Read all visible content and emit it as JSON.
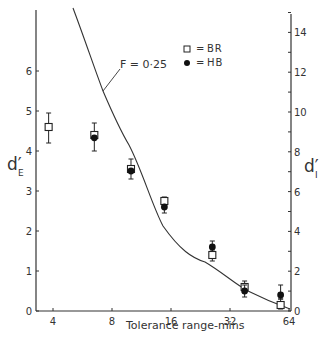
{
  "chart_data": {
    "type": "scatter",
    "title": "",
    "xlabel": "Tolerance range-mins",
    "x_scale": "log2",
    "x_ticks": [
      4,
      8,
      16,
      32,
      64
    ],
    "xlim": [
      3.3,
      64
    ],
    "ylabel_left": "d'E",
    "ylabel_left_main": "d′",
    "ylabel_left_sub": "E",
    "ylim_left": [
      0,
      7.5
    ],
    "y_ticks_left": [
      0,
      1,
      2,
      3,
      4,
      5,
      6
    ],
    "ylabel_right": "d'I",
    "ylabel_right_main": "d′",
    "ylabel_right_sub": "I",
    "ylim_right": [
      0,
      15
    ],
    "y_ticks_right": [
      0,
      2,
      4,
      6,
      8,
      10,
      12,
      14
    ],
    "grid": false,
    "legend_position": "upper-right-inside",
    "legend": [
      {
        "marker": "open-square",
        "symbol": "□",
        "eq": "=",
        "label": "BR"
      },
      {
        "marker": "filled-circle",
        "symbol": "●",
        "eq": "=",
        "label": "HB"
      }
    ],
    "series": [
      {
        "name": "BR",
        "marker": "open-square",
        "points": [
          {
            "x": 3.8,
            "y": 4.6,
            "err_low": 4.2,
            "err_high": 4.95
          },
          {
            "x": 6.5,
            "y": 4.4,
            "err_low": 4.0,
            "err_high": 4.7
          },
          {
            "x": 10.0,
            "y": 3.55,
            "err_low": 3.3,
            "err_high": 3.8
          },
          {
            "x": 14.8,
            "y": 2.75,
            "err_low": 2.45,
            "err_high": 2.85
          },
          {
            "x": 26.0,
            "y": 1.4,
            "err_low": 1.25,
            "err_high": 1.55
          },
          {
            "x": 38.0,
            "y": 0.6,
            "err_low": 0.45,
            "err_high": 0.75
          },
          {
            "x": 58.0,
            "y": 0.15,
            "err_low": 0.05,
            "err_high": 0.3
          }
        ]
      },
      {
        "name": "HB",
        "marker": "filled-circle",
        "points": [
          {
            "x": 6.5,
            "y": 4.33
          },
          {
            "x": 10.0,
            "y": 3.5
          },
          {
            "x": 14.8,
            "y": 2.6
          },
          {
            "x": 26.0,
            "y": 1.6,
            "err_low": 1.5,
            "err_high": 1.75
          },
          {
            "x": 38.0,
            "y": 0.5,
            "err_low": 0.35,
            "err_high": 0.65
          },
          {
            "x": 58.0,
            "y": 0.4,
            "err_low": 0.3,
            "err_high": 0.65
          }
        ]
      }
    ],
    "curve": {
      "label": "F=0.25",
      "description": "theoretical curve on right (d'I) axis",
      "points_right_axis": [
        [
          5.5,
          15.0
        ],
        [
          7.4,
          11.0
        ],
        [
          10.0,
          8.3
        ],
        [
          14.8,
          4.1
        ],
        [
          24.0,
          2.5
        ],
        [
          38.0,
          1.1
        ],
        [
          64.0,
          0.1
        ]
      ]
    },
    "annotations": [
      {
        "text": "F = 0·25",
        "target_x": 7.4,
        "target_y_left": 5.5
      }
    ]
  },
  "labels": {
    "xlabel": "Tolerance range-mins",
    "annotation": "F = 0·25"
  }
}
